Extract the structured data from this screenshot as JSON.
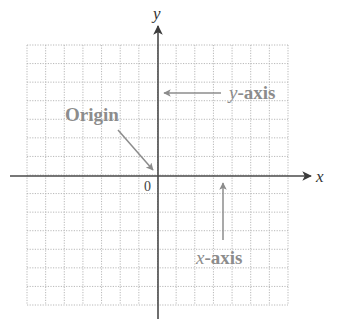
{
  "diagram": {
    "axes": {
      "x_label": "x",
      "y_label": "y",
      "origin_label": "0"
    },
    "annotations": {
      "origin": "Origin",
      "y_axis_prefix": "y",
      "y_axis_suffix": "-axis",
      "x_axis_prefix": "x",
      "x_axis_suffix": "-axis"
    },
    "grid": {
      "columns": 14,
      "rows": 14,
      "left": 27,
      "top": 45,
      "right": 288,
      "bottom": 305,
      "origin_x": 158,
      "origin_y": 176
    },
    "colors": {
      "axis": "#4a4a4a",
      "grid": "#b8b8b8",
      "annotation": "#8c8c8c",
      "label": "#333333"
    }
  }
}
